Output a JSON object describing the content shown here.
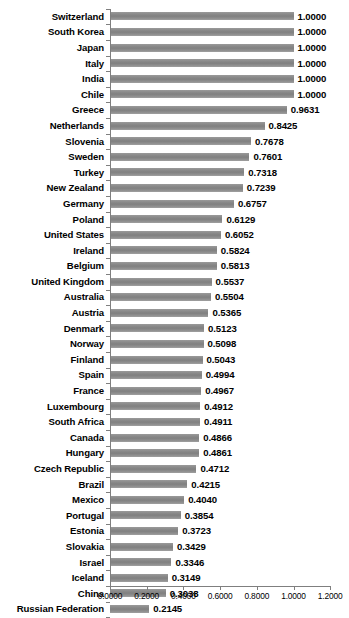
{
  "chart_data": {
    "type": "bar",
    "orientation": "horizontal",
    "title": "",
    "subtitle": "",
    "xlabel": "",
    "ylabel": "",
    "xlim": [
      0.0,
      1.2
    ],
    "xticks": [
      "0.0000",
      "0.2000",
      "0.4000",
      "0.6000",
      "0.8000",
      "1.0000",
      "1.2000"
    ],
    "xtick_values": [
      0.0,
      0.2,
      0.4,
      0.6,
      0.8,
      1.0,
      1.2
    ],
    "grid": false,
    "legend": null,
    "legend_position": "none",
    "bar_color": "#8c8c8c",
    "axis_color": "#7f7f7f",
    "text_color": "#000000",
    "value_label_format": "0.0000",
    "categories": [
      "Switzerland",
      "South Korea",
      "Japan",
      "Italy",
      "India",
      "Chile",
      "Greece",
      "Netherlands",
      "Slovenia",
      "Sweden",
      "Turkey",
      "New Zealand",
      "Germany",
      "Poland",
      "United States",
      "Ireland",
      "Belgium",
      "United Kingdom",
      "Australia",
      "Austria",
      "Denmark",
      "Norway",
      "Finland",
      "Spain",
      "France",
      "Luxembourg",
      "South Africa",
      "Canada",
      "Hungary",
      "Czech Republic",
      "Brazil",
      "Mexico",
      "Portugal",
      "Estonia",
      "Slovakia",
      "Israel",
      "Iceland",
      "China",
      "Russian Federation"
    ],
    "values": [
      1.0,
      1.0,
      1.0,
      1.0,
      1.0,
      1.0,
      0.9631,
      0.8425,
      0.7678,
      0.7601,
      0.7318,
      0.7239,
      0.6757,
      0.6129,
      0.6052,
      0.5824,
      0.5813,
      0.5537,
      0.5504,
      0.5365,
      0.5123,
      0.5098,
      0.5043,
      0.4994,
      0.4967,
      0.4912,
      0.4911,
      0.4866,
      0.4861,
      0.4712,
      0.4215,
      0.404,
      0.3854,
      0.3723,
      0.3429,
      0.3346,
      0.3149,
      0.3038,
      0.2145
    ],
    "value_labels": [
      "1.0000",
      "1.0000",
      "1.0000",
      "1.0000",
      "1.0000",
      "1.0000",
      "0.9631",
      "0.8425",
      "0.7678",
      "0.7601",
      "0.7318",
      "0.7239",
      "0.6757",
      "0.6129",
      "0.6052",
      "0.5824",
      "0.5813",
      "0.5537",
      "0.5504",
      "0.5365",
      "0.5123",
      "0.5098",
      "0.5043",
      "0.4994",
      "0.4967",
      "0.4912",
      "0.4911",
      "0.4866",
      "0.4861",
      "0.4712",
      "0.4215",
      "0.4040",
      "0.3854",
      "0.3723",
      "0.3429",
      "0.3346",
      "0.3149",
      "0.3038",
      "0.2145"
    ]
  }
}
